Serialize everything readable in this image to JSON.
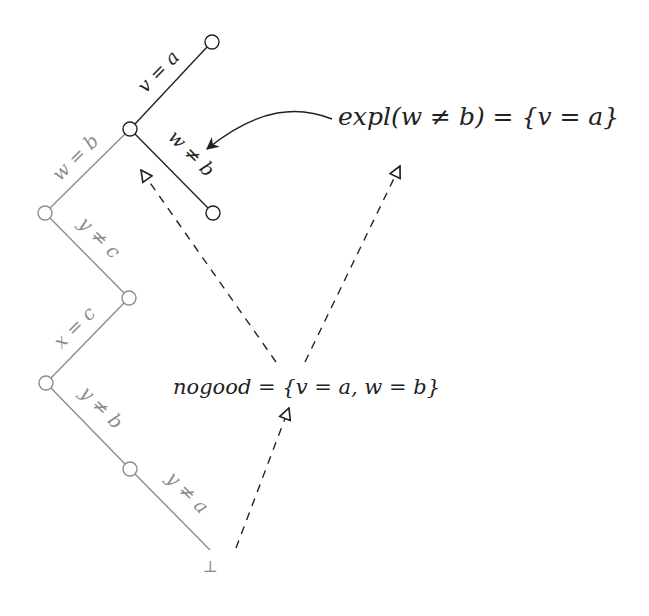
{
  "diagram": {
    "type": "search-tree-with-explanation",
    "colors": {
      "active_path": "#222222",
      "inactive_path": "#8c8c8c",
      "dashed_arrow": "#222222",
      "background": "#ffffff"
    },
    "nodes": [
      {
        "id": "n0",
        "x": 212,
        "y": 42,
        "state": "active"
      },
      {
        "id": "n1",
        "x": 130,
        "y": 129,
        "state": "active"
      },
      {
        "id": "n2",
        "x": 213,
        "y": 213,
        "state": "active"
      },
      {
        "id": "n3",
        "x": 45,
        "y": 213,
        "state": "inactive"
      },
      {
        "id": "n4",
        "x": 129,
        "y": 298,
        "state": "inactive"
      },
      {
        "id": "n5",
        "x": 46,
        "y": 383,
        "state": "inactive"
      },
      {
        "id": "n6",
        "x": 130,
        "y": 469,
        "state": "inactive"
      }
    ],
    "root_symbol": "⊥",
    "edges": [
      {
        "from": "n1",
        "to": "n0",
        "label": "v = a",
        "state": "active"
      },
      {
        "from": "n1",
        "to": "n2",
        "label": "w ≠ b",
        "state": "active"
      },
      {
        "from": "n3",
        "to": "n1",
        "label": "w = b",
        "state": "inactive"
      },
      {
        "from": "n3",
        "to": "n4",
        "label": "y ≠ c",
        "state": "inactive"
      },
      {
        "from": "n5",
        "to": "n4",
        "label": "x = c",
        "state": "inactive"
      },
      {
        "from": "n5",
        "to": "n6",
        "label": "y ≠ b",
        "state": "inactive"
      },
      {
        "from": "n6",
        "to": "root",
        "label": "y ≠ a",
        "state": "inactive"
      }
    ],
    "labels": {
      "edge_v_eq_a": "v = a",
      "edge_w_neq_b": "w ≠ b",
      "edge_w_eq_b": "w = b",
      "edge_y_neq_c": "y ≠ c",
      "edge_x_eq_c": "x = c",
      "edge_y_neq_b": "y ≠ b",
      "edge_y_neq_a": "y ≠ a",
      "explanation": "expl(w ≠ b) = {v = a}",
      "nogood": "nogood = {v = a, w = b}",
      "root": "⊥"
    }
  }
}
